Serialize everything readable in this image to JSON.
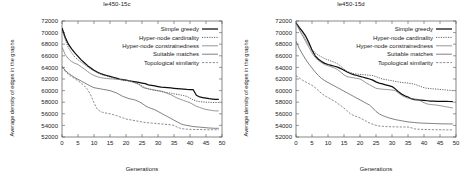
{
  "figure": {
    "ylabel": "Average density of edges in the graphs",
    "xlabel": "Generations"
  },
  "panels": [
    {
      "title": "le450-15c"
    },
    {
      "title": "le450-15d"
    }
  ],
  "legend": {
    "entries": [
      {
        "label": "Simple greedy",
        "style": "solid-thick",
        "color": "#111111"
      },
      {
        "label": "Hyper-node cardinality",
        "style": "dotted",
        "color": "#333333"
      },
      {
        "label": "Hyper-node constrainedness",
        "style": "solid-thin",
        "color": "#555555"
      },
      {
        "label": "Suitable matches",
        "style": "solid-thin",
        "color": "#444444"
      },
      {
        "label": "Topological similarity",
        "style": "dashed",
        "color": "#555555"
      }
    ]
  },
  "chart_data": [
    {
      "type": "line",
      "title": "le450-15c",
      "xlabel": "Generations",
      "ylabel": "Average density of edges in the graphs",
      "xlim": [
        0,
        50
      ],
      "ylim": [
        52000,
        72000
      ],
      "xticks": [
        0,
        5,
        10,
        15,
        20,
        25,
        30,
        35,
        40,
        45,
        50
      ],
      "yticks": [
        52000,
        54000,
        56000,
        58000,
        60000,
        62000,
        64000,
        66000,
        68000,
        70000,
        72000
      ],
      "grid": false,
      "legend_position": "upper-right",
      "x": [
        0,
        1,
        2,
        3,
        4,
        5,
        6,
        7,
        8,
        9,
        10,
        11,
        12,
        13,
        14,
        15,
        16,
        17,
        18,
        19,
        20,
        21,
        22,
        23,
        24,
        25,
        26,
        27,
        28,
        29,
        30,
        31,
        32,
        33,
        34,
        35,
        36,
        37,
        38,
        39,
        40,
        41,
        42,
        43,
        44,
        45,
        46,
        47,
        48,
        49
      ],
      "series": [
        {
          "name": "Simple greedy",
          "values": [
            70800,
            69200,
            68000,
            67200,
            66500,
            65900,
            65300,
            64800,
            64300,
            63900,
            63500,
            63200,
            62950,
            62750,
            62600,
            62450,
            62300,
            62150,
            62000,
            61900,
            61800,
            61700,
            61600,
            61500,
            61400,
            61300,
            61200,
            61000,
            60900,
            60800,
            60700,
            60600,
            60550,
            60500,
            60450,
            60400,
            60350,
            60300,
            60250,
            60200,
            60180,
            60150,
            59200,
            58900,
            58800,
            58700,
            58600,
            58550,
            58500,
            58500
          ]
        },
        {
          "name": "Hyper-node cardinality",
          "values": [
            70800,
            68800,
            67400,
            66500,
            65800,
            65300,
            64900,
            64500,
            64100,
            63700,
            63400,
            63100,
            62850,
            62650,
            62500,
            62350,
            62200,
            62050,
            61900,
            61800,
            61700,
            61600,
            61500,
            61350,
            61100,
            60800,
            60500,
            60300,
            60150,
            60050,
            59950,
            59850,
            59750,
            59650,
            59550,
            59450,
            59350,
            59250,
            59150,
            59000,
            58700,
            58400,
            58200,
            58100,
            58050,
            58000,
            57980,
            57960,
            57950,
            57950
          ]
        },
        {
          "name": "Hyper-node constrainedness",
          "values": [
            67500,
            66200,
            65500,
            65000,
            64700,
            64500,
            64100,
            63700,
            63300,
            62900,
            62600,
            62400,
            62250,
            62150,
            62080,
            62030,
            62000,
            61950,
            61900,
            61850,
            61800,
            61700,
            61500,
            61300,
            61100,
            60600,
            60400,
            60300,
            60200,
            60100,
            60000,
            59900,
            59700,
            59500,
            59300,
            59000,
            58700,
            58500,
            58300,
            58100,
            57900,
            57600,
            57300,
            57100,
            56900,
            56750,
            56650,
            56560,
            56500,
            56500
          ]
        },
        {
          "name": "Suitable matches",
          "values": [
            64200,
            63500,
            63000,
            62600,
            62250,
            61950,
            61650,
            61350,
            61050,
            60750,
            60500,
            60400,
            60300,
            60200,
            60100,
            60000,
            59800,
            59600,
            59300,
            59000,
            58800,
            58600,
            58500,
            58350,
            58100,
            57800,
            57400,
            57100,
            56900,
            56700,
            56400,
            56100,
            55800,
            55500,
            55200,
            54900,
            54600,
            54300,
            54100,
            54000,
            53900,
            53800,
            53750,
            53700,
            53650,
            53600,
            53550,
            53520,
            53500,
            53500
          ]
        },
        {
          "name": "Topological similarity",
          "values": [
            64000,
            63300,
            62800,
            62400,
            62050,
            61700,
            61300,
            60800,
            60200,
            59200,
            57900,
            56800,
            56400,
            56200,
            56100,
            56000,
            55850,
            55700,
            55500,
            55300,
            55100,
            55000,
            54900,
            54800,
            54700,
            54600,
            54500,
            54450,
            54400,
            54350,
            54300,
            54250,
            54200,
            54150,
            54100,
            54000,
            53700,
            53500,
            53400,
            53350,
            53320,
            53300,
            53290,
            53280,
            53270,
            53260,
            53250,
            53250,
            53250,
            53250
          ]
        }
      ]
    },
    {
      "type": "line",
      "title": "le450-15d",
      "xlabel": "Generations",
      "ylabel": "Average density of edges in the graphs",
      "xlim": [
        0,
        50
      ],
      "ylim": [
        52000,
        72000
      ],
      "xticks": [
        0,
        5,
        10,
        15,
        20,
        25,
        30,
        35,
        40,
        45,
        50
      ],
      "yticks": [
        52000,
        54000,
        56000,
        58000,
        60000,
        62000,
        64000,
        66000,
        68000,
        70000,
        72000
      ],
      "grid": false,
      "legend_position": "upper-right",
      "x": [
        0,
        1,
        2,
        3,
        4,
        5,
        6,
        7,
        8,
        9,
        10,
        11,
        12,
        13,
        14,
        15,
        16,
        17,
        18,
        19,
        20,
        21,
        22,
        23,
        24,
        25,
        26,
        27,
        28,
        29,
        30,
        31,
        32,
        33,
        34,
        35,
        36,
        37,
        38,
        39,
        40,
        41,
        42,
        43,
        44,
        45,
        46,
        47,
        48,
        49
      ],
      "series": [
        {
          "name": "Simple greedy",
          "values": [
            71700,
            70900,
            70200,
            69400,
            68300,
            67000,
            66000,
            65400,
            65000,
            64700,
            64500,
            64350,
            64200,
            64050,
            63800,
            63500,
            63200,
            62950,
            62750,
            62600,
            62450,
            62300,
            62150,
            62000,
            61800,
            61500,
            61300,
            61150,
            61000,
            60850,
            60700,
            60300,
            59800,
            59400,
            59100,
            58900,
            58600,
            58450,
            58400,
            58350,
            58300,
            58250,
            58200,
            58180,
            58160,
            58150,
            58140,
            58130,
            58120,
            58120
          ]
        },
        {
          "name": "Hyper-node cardinality",
          "values": [
            71700,
            70600,
            69700,
            68800,
            67900,
            67100,
            66500,
            66100,
            65800,
            65500,
            65300,
            65100,
            64900,
            64600,
            64200,
            63700,
            63300,
            63100,
            62950,
            62850,
            62800,
            62750,
            62700,
            62650,
            62600,
            62400,
            62200,
            62000,
            61900,
            61800,
            61700,
            61600,
            61500,
            61400,
            61350,
            61300,
            61200,
            61100,
            60900,
            60700,
            60500,
            60400,
            60350,
            60300,
            60250,
            60200,
            60150,
            60100,
            60050,
            60000
          ]
        },
        {
          "name": "Hyper-node constrainedness",
          "values": [
            71700,
            70500,
            69500,
            68500,
            67500,
            66500,
            65700,
            65200,
            64800,
            64500,
            64300,
            64100,
            63900,
            63600,
            63200,
            62700,
            62400,
            62300,
            62200,
            62100,
            62000,
            61700,
            61300,
            61000,
            60700,
            60400,
            60300,
            60250,
            60200,
            60150,
            60100,
            60000,
            59600,
            59200,
            58900,
            58700,
            58600,
            58550,
            58500,
            58200,
            57900,
            57700,
            57600,
            57550,
            57500,
            57400,
            57300,
            57200,
            57100,
            57000
          ]
        },
        {
          "name": "Suitable matches",
          "values": [
            68500,
            67300,
            66300,
            65400,
            64600,
            63900,
            63200,
            62600,
            62100,
            61700,
            61400,
            61100,
            60800,
            60500,
            60200,
            59900,
            59600,
            59300,
            59000,
            58700,
            58400,
            58100,
            57800,
            57500,
            57000,
            56400,
            56000,
            55700,
            55500,
            55300,
            55150,
            55000,
            54900,
            54800,
            54700,
            54600,
            54550,
            54500,
            54450,
            54400,
            54380,
            54360,
            54340,
            54320,
            54300,
            54280,
            54270,
            54260,
            54250,
            54250
          ]
        },
        {
          "name": "Topological similarity",
          "values": [
            62600,
            62200,
            61800,
            61500,
            61200,
            60900,
            60500,
            60000,
            59500,
            59100,
            58800,
            58500,
            58200,
            57800,
            57400,
            57000,
            56500,
            56000,
            55700,
            55500,
            55300,
            55000,
            54700,
            54400,
            54200,
            54000,
            53900,
            53850,
            53800,
            53780,
            53760,
            53750,
            53740,
            53730,
            53720,
            53710,
            53600,
            53400,
            53350,
            53320,
            53300,
            53290,
            53280,
            53270,
            53260,
            53250,
            53240,
            53230,
            53220,
            53220
          ]
        }
      ]
    }
  ]
}
